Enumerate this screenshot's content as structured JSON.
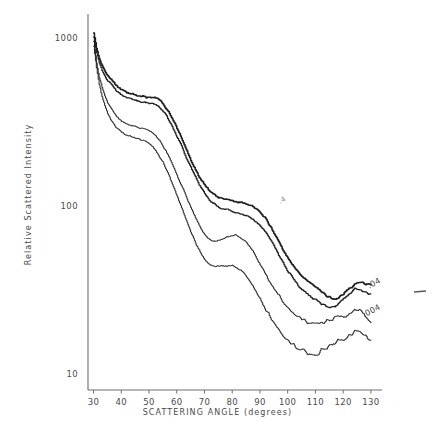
{
  "chart_data": {
    "type": "line",
    "title": "",
    "xlabel": "SCATTERING ANGLE (degrees)",
    "ylabel": "Relative Scattered Intensity",
    "yscale": "log",
    "xscale": "linear",
    "xlim": [
      28,
      134
    ],
    "ylim": [
      8,
      1400
    ],
    "grid": false,
    "legend_position": "inline-right",
    "xticks": [
      30,
      40,
      50,
      60,
      70,
      80,
      90,
      100,
      110,
      120,
      130
    ],
    "yticks": [
      10,
      100,
      1000
    ],
    "ytick_labels": [
      "10",
      "100",
      "1000"
    ],
    "annotations": [
      {
        "text": ".4",
        "x": 97,
        "y": 105,
        "style": "faint"
      },
      {
        "text": ".04",
        "x": 129,
        "y": 33,
        "style": "normal"
      },
      {
        "text": ".004",
        "x": 127,
        "y": 22,
        "style": "normal"
      }
    ],
    "series": [
      {
        "name": ".4",
        "label": ".4",
        "width": 1.5,
        "x": [
          30,
          31,
          32,
          33,
          34,
          35,
          36,
          37,
          38,
          39,
          40,
          41,
          42,
          43,
          44,
          45,
          46,
          47,
          48,
          49,
          50,
          51,
          52,
          53,
          54,
          55,
          56,
          57,
          58,
          59,
          60,
          61,
          62,
          63,
          64,
          65,
          66,
          67,
          68,
          69,
          70,
          71,
          72,
          73,
          74,
          75,
          76,
          77,
          78,
          79,
          80,
          81,
          82,
          83,
          84,
          85,
          86,
          87,
          88,
          89,
          90,
          91,
          92,
          93,
          94,
          95,
          96,
          97,
          98,
          99,
          100,
          101,
          102,
          103,
          104,
          105,
          106,
          107,
          108,
          109,
          110,
          111,
          112,
          113,
          114,
          115,
          116,
          117,
          118,
          119,
          120,
          121,
          122,
          123,
          124,
          125,
          126,
          127,
          128,
          129,
          130
        ],
        "y": [
          1080,
          880,
          760,
          690,
          640,
          600,
          572,
          548,
          528,
          512,
          498,
          487,
          478,
          470,
          464,
          459,
          455,
          452,
          450,
          449,
          448,
          446,
          442,
          434,
          422,
          406,
          386,
          364,
          340,
          316,
          292,
          268,
          246,
          225,
          206,
          189,
          174,
          161,
          150,
          141,
          133,
          127,
          122,
          118,
          115,
          113,
          112,
          111,
          110,
          109,
          108,
          107,
          106,
          105,
          104,
          103,
          102,
          100,
          98,
          95,
          92,
          88,
          84,
          79,
          74,
          69,
          64,
          60,
          56,
          52,
          49,
          46,
          44,
          42,
          40,
          38,
          37,
          36,
          35,
          34,
          33,
          32,
          31,
          30,
          29,
          29,
          28,
          28,
          28,
          29,
          30,
          31,
          32,
          33,
          34,
          35,
          35,
          35,
          34,
          34,
          34
        ]
      },
      {
        "name": ".4-duplicate",
        "label": "",
        "width": 1.2,
        "x": [
          30,
          31,
          32,
          33,
          34,
          35,
          36,
          37,
          38,
          39,
          40,
          41,
          42,
          43,
          44,
          45,
          46,
          47,
          48,
          49,
          50,
          51,
          52,
          53,
          54,
          55,
          56,
          57,
          58,
          59,
          60,
          61,
          62,
          63,
          64,
          65,
          66,
          67,
          68,
          69,
          70,
          71,
          72,
          73,
          74,
          75,
          76,
          77,
          78,
          79,
          80,
          81,
          82,
          83,
          84,
          85,
          86,
          87,
          88,
          89,
          90,
          91,
          92,
          93,
          94,
          95,
          96,
          97,
          98,
          99,
          100,
          101,
          102,
          103,
          104,
          105,
          106,
          107,
          108,
          109,
          110,
          111,
          112,
          113,
          114,
          115,
          116,
          117,
          118,
          119,
          120,
          121,
          122,
          123,
          124,
          125,
          126,
          127,
          128,
          129,
          130
        ],
        "y": [
          1020,
          830,
          715,
          648,
          600,
          563,
          536,
          513,
          494,
          478,
          465,
          454,
          446,
          438,
          432,
          427,
          423,
          420,
          418,
          416,
          414,
          411,
          406,
          397,
          385,
          369,
          350,
          329,
          306,
          284,
          262,
          241,
          221,
          202,
          185,
          170,
          157,
          145,
          135,
          126,
          119,
          113,
          108,
          104,
          101,
          99,
          97,
          96,
          95,
          94,
          93,
          92,
          91,
          90,
          89,
          88,
          86,
          84,
          82,
          80,
          77,
          74,
          70,
          66,
          62,
          58,
          54,
          50,
          47,
          44,
          41,
          39,
          37,
          35,
          33,
          32,
          31,
          30,
          29,
          28,
          28,
          27,
          26,
          26,
          25,
          25,
          25,
          25,
          26,
          27,
          28,
          29,
          30,
          31,
          32,
          32,
          32,
          31,
          31,
          30,
          30
        ]
      },
      {
        "name": ".04",
        "label": ".04",
        "width": 1.0,
        "x": [
          30,
          31,
          32,
          33,
          34,
          35,
          36,
          37,
          38,
          39,
          40,
          41,
          42,
          43,
          44,
          45,
          46,
          47,
          48,
          49,
          50,
          51,
          52,
          53,
          54,
          55,
          56,
          57,
          58,
          59,
          60,
          61,
          62,
          63,
          64,
          65,
          66,
          67,
          68,
          69,
          70,
          71,
          72,
          73,
          74,
          75,
          76,
          77,
          78,
          79,
          80,
          81,
          82,
          83,
          84,
          85,
          86,
          87,
          88,
          89,
          90,
          91,
          92,
          93,
          94,
          95,
          96,
          97,
          98,
          99,
          100,
          101,
          102,
          103,
          104,
          105,
          106,
          107,
          108,
          109,
          110,
          111,
          112,
          113,
          114,
          115,
          116,
          117,
          118,
          119,
          120,
          121,
          122,
          123,
          124,
          125,
          126,
          127,
          128,
          129,
          130
        ],
        "y": [
          960,
          720,
          590,
          510,
          455,
          415,
          386,
          364,
          347,
          334,
          324,
          317,
          311,
          306,
          302,
          299,
          296,
          293,
          290,
          286,
          281,
          274,
          265,
          254,
          241,
          227,
          212,
          197,
          182,
          167,
          153,
          140,
          128,
          117,
          107,
          98,
          90,
          83,
          77,
          72,
          68,
          65,
          63,
          62,
          62,
          62,
          63,
          64,
          65,
          66,
          67,
          67,
          66,
          65,
          63,
          61,
          58,
          55,
          52,
          48,
          45,
          42,
          39,
          36,
          34,
          32,
          30,
          29,
          27,
          26,
          25,
          24,
          23,
          22,
          22,
          21,
          21,
          20,
          20,
          20,
          20,
          20,
          20,
          20,
          21,
          21,
          21,
          22,
          22,
          22,
          22,
          22,
          23,
          23,
          24,
          24,
          24,
          23,
          22,
          21,
          20
        ]
      },
      {
        "name": ".004",
        "label": ".004",
        "width": 1.0,
        "x": [
          30,
          31,
          32,
          33,
          34,
          35,
          36,
          37,
          38,
          39,
          40,
          41,
          42,
          43,
          44,
          45,
          46,
          47,
          48,
          49,
          50,
          51,
          52,
          53,
          54,
          55,
          56,
          57,
          58,
          59,
          60,
          61,
          62,
          63,
          64,
          65,
          66,
          67,
          68,
          69,
          70,
          71,
          72,
          73,
          74,
          75,
          76,
          77,
          78,
          79,
          80,
          81,
          82,
          83,
          84,
          85,
          86,
          87,
          88,
          89,
          90,
          91,
          92,
          93,
          94,
          95,
          96,
          97,
          98,
          99,
          100,
          101,
          102,
          103,
          104,
          105,
          106,
          107,
          108,
          109,
          110,
          111,
          112,
          113,
          114,
          115,
          116,
          117,
          118,
          119,
          120,
          121,
          122,
          123,
          124,
          125,
          126,
          127,
          128,
          129,
          130
        ],
        "y": [
          900,
          660,
          530,
          450,
          396,
          358,
          331,
          311,
          296,
          285,
          276,
          270,
          265,
          261,
          258,
          255,
          252,
          249,
          245,
          240,
          234,
          226,
          217,
          206,
          194,
          181,
          167,
          153,
          140,
          127,
          115,
          104,
          94,
          85,
          77,
          70,
          64,
          59,
          55,
          51,
          48,
          46,
          45,
          44,
          44,
          44,
          44,
          44,
          44,
          44,
          44,
          43,
          42,
          41,
          40,
          38,
          36,
          34,
          32,
          30,
          28,
          26,
          24,
          23,
          21,
          20,
          19,
          18,
          17,
          16,
          16,
          15,
          15,
          14,
          14,
          14,
          14,
          13,
          13,
          13,
          13,
          13,
          14,
          14,
          14,
          15,
          15,
          15,
          16,
          16,
          16,
          16,
          17,
          17,
          18,
          18,
          18,
          17,
          17,
          16,
          16
        ]
      }
    ]
  },
  "marks": {
    "right_dash": {
      "x": 420,
      "y": 292
    }
  }
}
